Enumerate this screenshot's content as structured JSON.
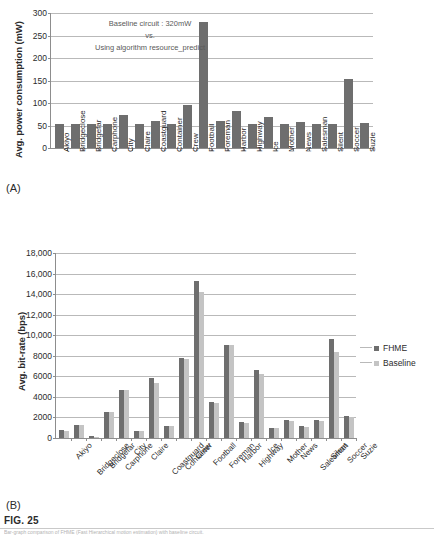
{
  "figure": {
    "label": "FIG. 25",
    "panel_a_tag": "(A)",
    "panel_b_tag": "(B)",
    "footer_caption": "Bar-graph comparison of FHME (Fast Hierarchical motion estimation) with baseline circuit."
  },
  "chart_data": [
    {
      "id": "panel-a",
      "type": "bar",
      "title": "",
      "xlabel": "",
      "ylabel": "Avg. power consumption (mW)",
      "ylim": [
        0,
        300
      ],
      "yticks": [
        0,
        50,
        100,
        150,
        200,
        250,
        300
      ],
      "ytick_labels": [
        "0",
        "50",
        "100",
        "150",
        "200",
        "250",
        "300"
      ],
      "grid": true,
      "legend_position": "none",
      "annotation_lines": [
        "Baseline circuit : 320mW",
        "vs.",
        "Using algorithm resource_predict"
      ],
      "categories": [
        "Akiyo",
        "Bridgeclose",
        "Bridgefar",
        "Carphone",
        "City",
        "Claire",
        "Coastguard",
        "Container",
        "Crew",
        "Football",
        "Foreman",
        "Harbor",
        "Highway",
        "Ice",
        "Mother",
        "News",
        "Salesman",
        "Silent",
        "Soccer",
        "Suzie"
      ],
      "series": [
        {
          "name": "Avg. power consumption",
          "color": "#6e6e6e",
          "values": [
            54,
            54,
            54,
            54,
            73,
            54,
            61,
            54,
            95,
            280,
            60,
            82,
            54,
            68,
            54,
            57,
            54,
            54,
            153,
            55
          ]
        }
      ]
    },
    {
      "id": "panel-b",
      "type": "bar",
      "title": "",
      "xlabel": "",
      "ylabel": "Avg. bit-rate (bps)",
      "ylim": [
        0,
        18000
      ],
      "yticks": [
        0,
        2000,
        4000,
        6000,
        8000,
        10000,
        12000,
        14000,
        16000,
        18000
      ],
      "ytick_labels": [
        "0",
        "2000",
        "4000",
        "6000",
        "8000",
        "10,000",
        "12,000",
        "14,000",
        "16,000",
        "18,000"
      ],
      "grid": true,
      "legend_position": "right",
      "categories": [
        "Akiyo",
        "Bridgeclose",
        "Bridgefar",
        "Carphone",
        "City",
        "Claire",
        "Coastguard",
        "Container",
        "Crew",
        "Football",
        "Foreman",
        "Harbor",
        "Highway",
        "Ice",
        "Mother",
        "News",
        "Salesman",
        "Silent",
        "Soccer",
        "Suzie"
      ],
      "series": [
        {
          "name": "FHME",
          "color": "#6e6e6e",
          "values": [
            780,
            1280,
            150,
            2550,
            4680,
            730,
            5850,
            1180,
            7750,
            15300,
            3520,
            9080,
            1600,
            6630,
            1020,
            1760,
            1130,
            1740,
            9620,
            2150
          ]
        },
        {
          "name": "Baseline",
          "color": "#c4c4c4",
          "values": [
            700,
            1230,
            120,
            2500,
            4650,
            700,
            5380,
            1130,
            7720,
            14200,
            3450,
            9080,
            1490,
            6180,
            960,
            1700,
            1080,
            1680,
            8380,
            2080
          ]
        }
      ]
    }
  ]
}
